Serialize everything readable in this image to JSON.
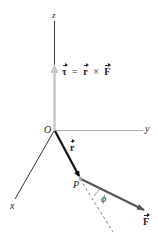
{
  "diagram": {
    "axes": {
      "z_label": "z",
      "y_label": "y",
      "x_label": "x",
      "origin_label": "O"
    },
    "point_label": "P",
    "angle_label": "ϕ",
    "vectors": {
      "torque": {
        "symbol": "τ",
        "color": "#c8c8c8"
      },
      "position": {
        "symbol": "r",
        "color": "#111111"
      },
      "force": {
        "symbol": "F",
        "color": "#555555"
      }
    },
    "equation": {
      "lhs": "τ",
      "equals": "=",
      "r": "r",
      "times": "×",
      "f": "F"
    },
    "colors": {
      "axis": "#333333",
      "axis_light": "#aaaaaa",
      "dashed": "#666666"
    }
  }
}
